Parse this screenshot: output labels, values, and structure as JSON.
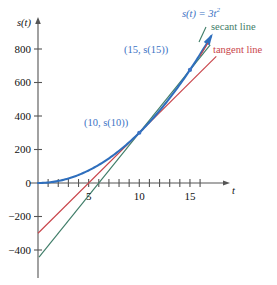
{
  "chart_data": {
    "type": "line",
    "title": "",
    "xlabel": "t",
    "ylabel": "s(t)",
    "function_label": "s(t) = 3t",
    "function_exponent": "2",
    "xlim": [
      -1.5,
      18.8
    ],
    "ylim": [
      -560,
      900
    ],
    "grid": false,
    "legend_position": "top-right",
    "xticks": [
      1,
      2,
      3,
      4,
      5,
      6,
      7,
      8,
      9,
      10,
      11,
      12,
      13,
      14,
      15,
      16
    ],
    "xtick_labels": [
      {
        "value": 5,
        "label": "5"
      },
      {
        "value": 10,
        "label": "10"
      },
      {
        "value": 15,
        "label": "15"
      }
    ],
    "yticks": [
      800,
      600,
      400,
      200,
      0,
      -200,
      -400
    ],
    "ytick_labels": [
      "800",
      "600",
      "400",
      "200",
      "0",
      "−200",
      "−400"
    ],
    "series": [
      {
        "name": "s(t) = 3t^2",
        "type": "curve",
        "color": "#2f6fbd",
        "expression": "3*t^2",
        "x_start": 0,
        "x_end": 17.1,
        "arrow_end": true
      },
      {
        "name": "secant line",
        "type": "line",
        "color": "#3f7d68",
        "slope": 75,
        "intercept": -450,
        "through_points": [
          [
            10,
            300
          ],
          [
            15,
            675
          ]
        ],
        "x_start": 0.1,
        "x_end": 17.0
      },
      {
        "name": "tangent line",
        "type": "line",
        "color": "#c9444a",
        "slope": 60,
        "intercept": -300,
        "through_points": [
          [
            10,
            300
          ]
        ],
        "x_start": 0,
        "x_end": 17.6
      }
    ],
    "points": [
      {
        "label": "(10, s(10))",
        "x": 10,
        "y": 300,
        "color": "#3b73c4"
      },
      {
        "label": "(15, s(15))",
        "x": 15,
        "y": 675,
        "color": "#3b73c4"
      }
    ],
    "legend": [
      {
        "label": "secant line",
        "color": "#3f7d68"
      },
      {
        "label": "tangent line",
        "color": "#c9444a"
      }
    ]
  },
  "annotations": {
    "point_10_label": "(10, s(10))",
    "point_15_label": "(15, s(15))",
    "curve_label_base": "s(t) = 3t",
    "curve_label_exp": "2",
    "secant_label": "secant line",
    "tangent_label": "tangent line",
    "y_axis_label": "s(t)",
    "x_axis_label": "t"
  },
  "axes": {
    "y_labels": [
      "800",
      "600",
      "400",
      "200",
      "0",
      "−200",
      "−400"
    ],
    "x_labels": [
      "5",
      "10",
      "15"
    ]
  },
  "colors": {
    "curve": "#2f6fbd",
    "secant": "#3f7d68",
    "tangent": "#c9444a",
    "axis": "#555555",
    "point_label": "#3b73c4"
  }
}
